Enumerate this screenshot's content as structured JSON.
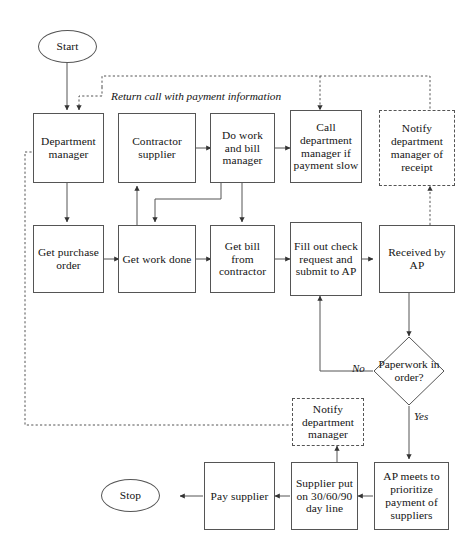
{
  "diagram": {
    "stroke_color": "#555555",
    "text_color": "#141414"
  },
  "terminals": [
    {
      "id": "start",
      "label": "Start"
    },
    {
      "id": "stop",
      "label": "Stop"
    }
  ],
  "nodes": {
    "department_manager": "Department manager",
    "contractor_supplier": "Contractor supplier",
    "do_work_bill": "Do work and bill manager",
    "call_department": "Call department manager if payment slow",
    "notify_receipt": "Notify department manager of receipt",
    "get_purchase_order": "Get purchase order",
    "get_work_done": "Get work done",
    "get_bill": "Get bill from contractor",
    "fill_out_check": "Fill out check request and submit to AP",
    "received_by_ap": "Received by AP",
    "notify_department_manager": "Notify department manager",
    "ap_meets": "AP meets to prioritize payment of suppliers",
    "supplier_put": "Supplier put on 30/60/90 day line",
    "pay_supplier": "Pay supplier"
  },
  "decision": {
    "label": "Paperwork in order?",
    "yes_label": "Yes",
    "no_label": "No"
  },
  "edge_labels": {
    "return_call": "Return call with payment information"
  }
}
